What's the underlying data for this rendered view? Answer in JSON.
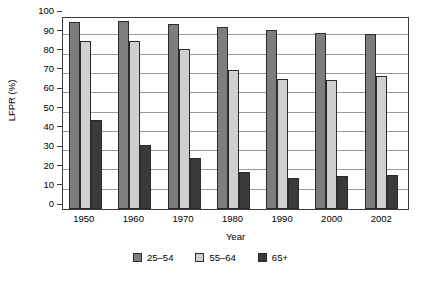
{
  "chart_data": {
    "type": "bar",
    "title": "",
    "subtitle": "",
    "xlabel": "Year",
    "ylabel": "LFPR (%)",
    "categories": [
      "1950",
      "1960",
      "1970",
      "1980",
      "1990",
      "2000",
      "2002"
    ],
    "series": [
      {
        "name": "25–54",
        "color": "#7d7d7d",
        "values": [
          97,
          97.5,
          96,
          94.5,
          93,
          91,
          90.5
        ]
      },
      {
        "name": "55–64",
        "color": "#cfcfcf",
        "values": [
          87,
          87,
          83,
          72,
          67.5,
          67,
          69
        ]
      },
      {
        "name": "65+",
        "color": "#3a3a3a",
        "values": [
          46,
          33,
          26.5,
          19,
          16,
          17,
          17.5
        ]
      }
    ],
    "ylim": [
      0,
      100
    ],
    "yticks": [
      0,
      10,
      20,
      30,
      40,
      50,
      60,
      70,
      80,
      90,
      100
    ],
    "ytick_labels": [
      "0",
      "10",
      "20",
      "30",
      "40",
      "50",
      "60",
      "70",
      "80",
      "90",
      "100"
    ],
    "grid": {
      "horizontal": true,
      "vertical": false,
      "color": "#9a9a9a"
    },
    "legend": {
      "position": "bottom-center",
      "orientation": "horizontal"
    },
    "axis_color": "#3b3b3b",
    "background": "#ffffff"
  }
}
